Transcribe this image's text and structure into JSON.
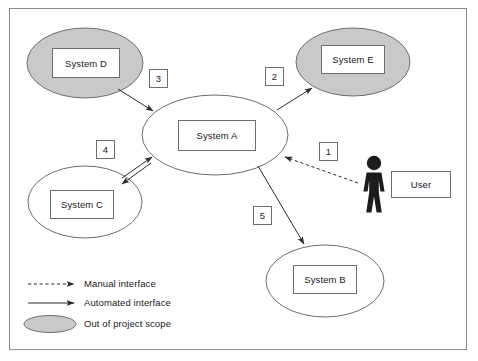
{
  "diagram": {
    "colors": {
      "out_of_scope_fill": "#c9c9c9",
      "node_stroke": "#6e6e6e",
      "line": "#3a3a3a",
      "frame": "#8c8c8c",
      "actor": "#1c1c1c",
      "text": "#1a1a1a"
    },
    "nodes": [
      {
        "id": "system_d",
        "label": "System D",
        "shape": "ellipse",
        "scope": "out-of-scope"
      },
      {
        "id": "system_e",
        "label": "System E",
        "shape": "ellipse",
        "scope": "out-of-scope"
      },
      {
        "id": "system_a",
        "label": "System A",
        "shape": "ellipse",
        "scope": "in-scope"
      },
      {
        "id": "system_c",
        "label": "System C",
        "shape": "ellipse",
        "scope": "in-scope"
      },
      {
        "id": "system_b",
        "label": "System B",
        "shape": "ellipse",
        "scope": "in-scope"
      },
      {
        "id": "user",
        "label": "User",
        "shape": "actor",
        "scope": "in-scope"
      }
    ],
    "interfaces": [
      {
        "number": "1",
        "from": "user",
        "to": "system_a",
        "type": "manual",
        "direction": "one-way"
      },
      {
        "number": "2",
        "from": "system_a",
        "to": "system_e",
        "type": "automated",
        "direction": "one-way"
      },
      {
        "number": "3",
        "from": "system_d",
        "to": "system_a",
        "type": "automated",
        "direction": "one-way"
      },
      {
        "number": "4",
        "from": "system_a",
        "to": "system_c",
        "type": "automated",
        "direction": "two-way"
      },
      {
        "number": "5",
        "from": "system_a",
        "to": "system_b",
        "type": "automated",
        "direction": "one-way"
      }
    ],
    "legend": {
      "items": [
        {
          "key": "manual",
          "label": "Manual interface",
          "symbol": "dashed-arrow"
        },
        {
          "key": "automated",
          "label": "Automated interface",
          "symbol": "solid-arrow"
        },
        {
          "key": "out_of_scope",
          "label": "Out of project scope",
          "symbol": "gray-ellipse"
        }
      ]
    }
  }
}
